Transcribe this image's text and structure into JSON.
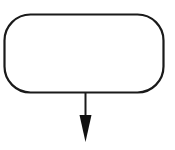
{
  "diagram": {
    "type": "flowchart-fragment",
    "nodes": [
      {
        "id": "terminator",
        "shape": "rounded-rectangle",
        "label": ""
      }
    ],
    "edges": [
      {
        "from": "terminator",
        "to": null,
        "direction": "down",
        "arrowhead": "filled"
      }
    ],
    "colors": {
      "stroke": "#1a1a1a",
      "fill": "#ffffff",
      "background": "#ffffff"
    }
  }
}
